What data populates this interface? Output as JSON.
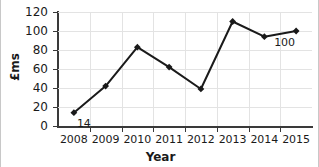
{
  "chart_data": {
    "type": "line",
    "title": "",
    "xlabel": "Year",
    "ylabel": "£ms",
    "categories": [
      "2008",
      "2009",
      "2010",
      "2011",
      "2012",
      "2013",
      "2014",
      "2015"
    ],
    "x": [
      2008,
      2009,
      2010,
      2011,
      2012,
      2013,
      2014,
      2015
    ],
    "values": [
      14,
      42,
      83,
      62,
      39,
      110,
      94,
      100
    ],
    "series": [
      {
        "name": "£ms",
        "values": [
          14,
          42,
          83,
          62,
          39,
          110,
          94,
          100
        ]
      }
    ],
    "ylim": [
      0,
      120
    ],
    "yticks": [
      0,
      20,
      40,
      60,
      80,
      100,
      120
    ],
    "ytick_labels": [
      "0",
      "20",
      "40",
      "60",
      "80",
      "100",
      "120"
    ],
    "xtick_labels": [
      "2008",
      "2009",
      "2010",
      "2011",
      "2012",
      "2013",
      "2014",
      "2015"
    ],
    "grid": true,
    "legend": false,
    "legend_position": "none",
    "marker": "diamond",
    "line_color": "#1a1a1a",
    "marker_color": "#1a1a1a",
    "grid_color": "#e3e3e3",
    "axis_color": "#3a3a3a",
    "background_color": "#ffffff",
    "annotations": [
      {
        "text": "14",
        "x": 2008,
        "y": 14,
        "position": "below-right"
      },
      {
        "text": "100",
        "x": 2015,
        "y": 100,
        "position": "below-left"
      }
    ]
  }
}
